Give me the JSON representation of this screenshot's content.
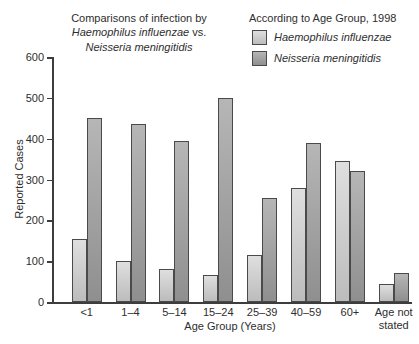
{
  "figure": {
    "title_left_lines": [
      {
        "text": "Comparisons of infection by",
        "italic": false,
        "tail": ""
      },
      {
        "text": "Haemophilus influenzae",
        "italic": true,
        "tail": " vs."
      },
      {
        "text": "Neisseria meningitidis",
        "italic": true,
        "tail": ""
      }
    ],
    "title_right": "According to Age Group, 1998"
  },
  "chart_data": {
    "type": "bar",
    "categories": [
      "<1",
      "1–4",
      "5–14",
      "15–24",
      "25–39",
      "40–59",
      "60+",
      "Age not stated"
    ],
    "series": [
      {
        "name": "Haemophilus influenzae",
        "values": [
          155,
          100,
          80,
          65,
          115,
          280,
          345,
          45
        ],
        "fill_top": "#dfdfdf",
        "fill_bottom": "#bcbcbc"
      },
      {
        "name": "Neisseria meningitidis",
        "values": [
          450,
          435,
          395,
          500,
          255,
          390,
          320,
          70
        ],
        "fill_top": "#b6b6b6",
        "fill_bottom": "#8f8f8f"
      }
    ],
    "xlabel": "Age Group (Years)",
    "ylabel": "Reported Cases",
    "ylim": [
      0,
      600
    ],
    "ytick_step": 100,
    "grid": false,
    "legend_position": "top-right",
    "axis_color": "#3d3d3d",
    "bar_border_color": "#4a4a4a",
    "text_color": "#2e2e2e"
  }
}
